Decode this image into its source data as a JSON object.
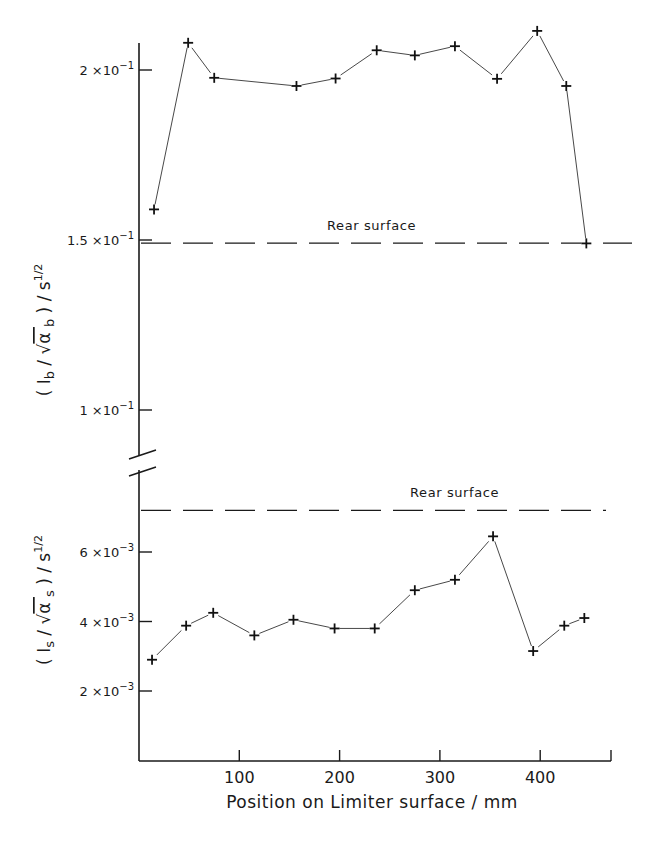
{
  "chart_data": [
    {
      "type": "line",
      "panel": "top",
      "title": "",
      "xlabel": "Position on Limiter surface / mm",
      "ylabel_parts": {
        "open": "( I",
        "sub1": "b",
        "slash": " / ",
        "sqrt_arg": "α",
        "sub2": "b",
        "close": " )  / s",
        "sup": "1/2"
      },
      "ylabel": "(I_b / √α_b) / s^1/2",
      "yticks": [
        0.2,
        0.15,
        0.1
      ],
      "ytick_labels": [
        {
          "mant": "2 ×10",
          "exp": "−1"
        },
        {
          "mant": "1.5 ×10",
          "exp": "−1"
        },
        {
          "mant": "1 ×10",
          "exp": "−1"
        }
      ],
      "ylim": [
        0.087,
        0.21
      ],
      "grid": false,
      "marker": "+",
      "series": [
        {
          "name": "Front surface",
          "x": [
            15,
            49,
            75,
            157,
            196,
            237,
            275,
            315,
            357,
            397,
            426,
            446
          ],
          "y": [
            0.159,
            0.208,
            0.1977,
            0.1953,
            0.1975,
            0.2058,
            0.2043,
            0.207,
            0.1974,
            0.2115,
            0.1953,
            0.149
          ]
        }
      ],
      "reference_line": {
        "label": "Rear surface",
        "y": 0.1491,
        "style": "dashed"
      }
    },
    {
      "type": "line",
      "panel": "bottom",
      "title": "",
      "xlabel": "Position on Limiter surface / mm",
      "ylabel_parts": {
        "open": "( I",
        "sub1": "s",
        "slash": " / ",
        "sqrt_arg": "α",
        "sub2": "s",
        "close": " )  / s",
        "sup": "1/2"
      },
      "ylabel": "(I_s / √α_s) / s^1/2",
      "yticks": [
        0.006,
        0.004,
        0.002
      ],
      "ytick_labels": [
        {
          "mant": "6 ×10",
          "exp": "−3"
        },
        {
          "mant": "4 ×10",
          "exp": "−3"
        },
        {
          "mant": "2 ×10",
          "exp": "−3"
        }
      ],
      "ylim": [
        0.0,
        0.0078
      ],
      "grid": false,
      "marker": "+",
      "series": [
        {
          "name": "Front surface",
          "x": [
            13,
            47,
            74,
            115,
            154,
            195,
            235,
            275,
            315,
            353,
            393,
            424,
            444
          ],
          "y": [
            0.0029,
            0.00388,
            0.00425,
            0.0036,
            0.00405,
            0.0038,
            0.0038,
            0.0049,
            0.0052,
            0.00645,
            0.00315,
            0.00388,
            0.0041
          ]
        }
      ],
      "reference_line": {
        "label": "Rear surface",
        "y": 0.0072,
        "style": "dashed"
      }
    }
  ],
  "xaxis": {
    "label": "Position on Limiter surface / mm",
    "ticks": [
      100,
      200,
      300,
      400
    ],
    "tick_labels": [
      "100",
      "200",
      "300",
      "400"
    ],
    "xlim": [
      0,
      470
    ]
  },
  "annotations": {
    "top_rear_label": "Rear surface",
    "bottom_rear_label": "Rear surface"
  }
}
